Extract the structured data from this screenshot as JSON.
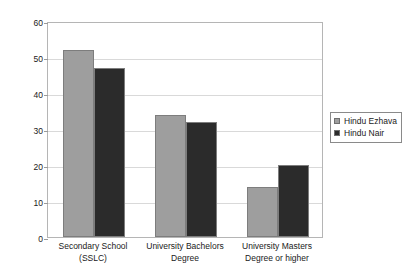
{
  "chart_data": {
    "type": "bar",
    "title": "",
    "subtitle": "",
    "xlabel": "",
    "ylabel": "",
    "ylim": [
      0,
      60
    ],
    "ytick_labels": [
      "0",
      "10",
      "20",
      "30",
      "40",
      "50",
      "60"
    ],
    "yticks": [
      0,
      10,
      20,
      30,
      40,
      50,
      60
    ],
    "grid": true,
    "legend_position": "right",
    "categories": [
      "Secondary School (SSLC)",
      "University Bachelors Degree",
      "University Masters Degree or higher"
    ],
    "category_lines": [
      [
        "Secondary School",
        "(SSLC)"
      ],
      [
        "University Bachelors",
        "Degree"
      ],
      [
        "University Masters",
        "Degree or higher"
      ]
    ],
    "series": [
      {
        "name": "Hindu Ezhava",
        "color": "#9e9e9e",
        "values": [
          52,
          34,
          14
        ]
      },
      {
        "name": "Hindu Nair",
        "color": "#2b2b2b",
        "values": [
          47,
          32,
          20
        ]
      }
    ]
  },
  "legend": {
    "items": [
      {
        "label": "Hindu Ezhava",
        "color": "#9e9e9e"
      },
      {
        "label": "Hindu Nair",
        "color": "#2b2b2b"
      }
    ]
  }
}
